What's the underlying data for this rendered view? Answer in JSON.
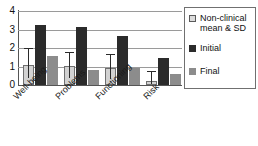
{
  "chart_data": {
    "type": "bar",
    "title": "",
    "subtitle": "",
    "xlabel": "",
    "ylabel": "",
    "ylim": [
      0,
      4
    ],
    "yticks": [
      "0",
      "1",
      "2",
      "3",
      "4"
    ],
    "grid": true,
    "legend_position": "right",
    "categories": [
      "Well-being",
      "Problems",
      "Functioning",
      "Risk"
    ],
    "series": [
      {
        "name": "Non-clinical mean & SD",
        "color": "#d2d2d2",
        "values": [
          1.1,
          1.02,
          0.9,
          0.22
        ],
        "errors_upper": [
          2.0,
          1.8,
          1.7,
          0.75
        ]
      },
      {
        "name": "Initial",
        "color": "#2b2b2b",
        "values": [
          3.25,
          3.12,
          2.65,
          1.45
        ],
        "errors_upper": [
          null,
          null,
          null,
          null
        ]
      },
      {
        "name": "Final",
        "color": "#8c8c8c",
        "values": [
          1.55,
          0.8,
          0.92,
          0.6
        ],
        "errors_upper": [
          null,
          null,
          null,
          null
        ]
      }
    ]
  },
  "legend": {
    "entries": [
      {
        "label": "Non-clinical mean & SD",
        "swatch": "nonclinical"
      },
      {
        "label": "Initial",
        "swatch": "initial"
      },
      {
        "label": "Final",
        "swatch": "final"
      }
    ]
  },
  "axis": {
    "y_tick_4": "4",
    "y_tick_3": "3",
    "y_tick_2": "2",
    "y_tick_1": "1",
    "y_tick_0": "0"
  },
  "categories": {
    "c0": "Well-being",
    "c1": "Problems",
    "c2": "Functioning",
    "c3": "Risk"
  }
}
